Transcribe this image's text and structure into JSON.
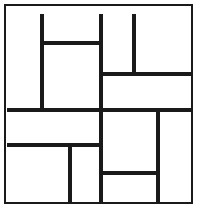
{
  "figure": {
    "type": "line-diagram",
    "canvas": {
      "width": 199,
      "height": 211,
      "background": "#ffffff"
    },
    "stroke": {
      "interior_color": "#1a1a1a",
      "interior_width": 4,
      "border_color": "#1a1a1a",
      "border_width": 2
    },
    "border": {
      "x": 5,
      "y": 5,
      "width": 187,
      "height": 198
    },
    "segments": [
      {
        "name": "vertical-left-upper",
        "orientation": "vertical",
        "x": 42,
        "y1": 14,
        "y2": 110
      },
      {
        "name": "vertical-center-full",
        "orientation": "vertical",
        "x": 101,
        "y1": 14,
        "y2": 203
      },
      {
        "name": "vertical-right-upper",
        "orientation": "vertical",
        "x": 134,
        "y1": 14,
        "y2": 75
      },
      {
        "name": "vertical-left-lower",
        "orientation": "vertical",
        "x": 70,
        "y1": 145,
        "y2": 203
      },
      {
        "name": "vertical-right-lower",
        "orientation": "vertical",
        "x": 158,
        "y1": 110,
        "y2": 203
      },
      {
        "name": "horizontal-upper-left",
        "orientation": "horizontal",
        "y": 43,
        "x1": 41,
        "x2": 103
      },
      {
        "name": "horizontal-upper-right",
        "orientation": "horizontal",
        "y": 74,
        "x1": 100,
        "x2": 192
      },
      {
        "name": "horizontal-middle-full",
        "orientation": "horizontal",
        "y": 110,
        "x1": 7,
        "x2": 192
      },
      {
        "name": "horizontal-lower-left",
        "orientation": "horizontal",
        "y": 145,
        "x1": 7,
        "x2": 103
      },
      {
        "name": "horizontal-lower-right",
        "orientation": "horizontal",
        "y": 173,
        "x1": 100,
        "x2": 159
      }
    ]
  }
}
